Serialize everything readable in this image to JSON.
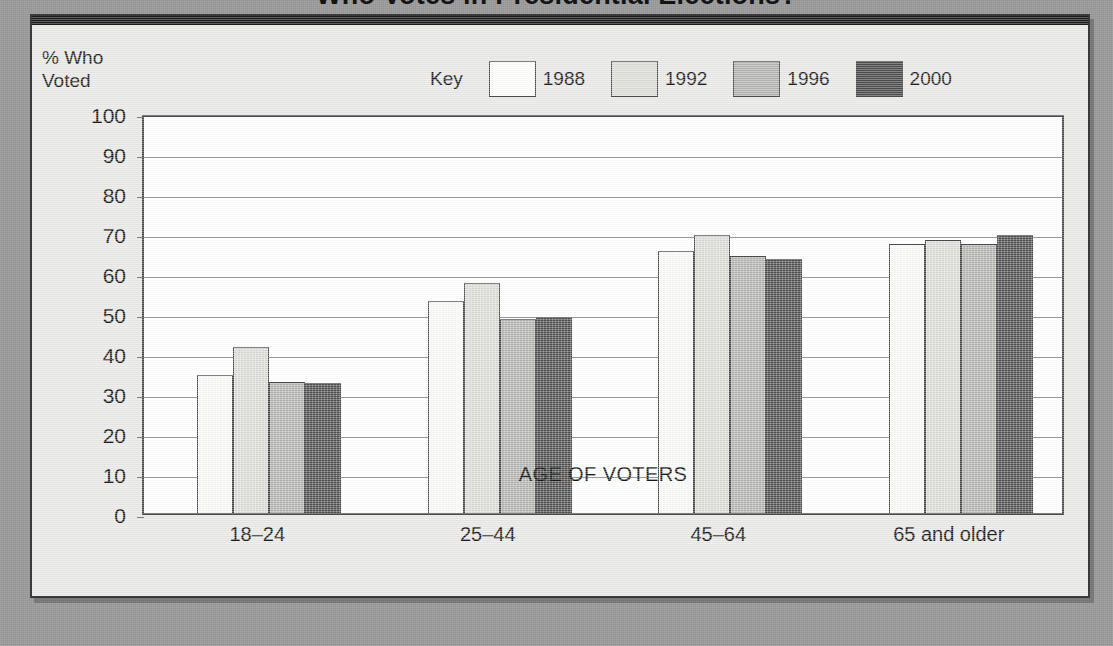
{
  "page": {
    "title_clipped": "Who Votes in Presidential Elections?",
    "background_color": "#9d9d9d",
    "card_color": "#e8e8e6"
  },
  "legend": {
    "key_label": "Key",
    "items": [
      {
        "label": "1988",
        "color": "#fbfbf9"
      },
      {
        "label": "1992",
        "color": "#dcdcd8"
      },
      {
        "label": "1996",
        "color": "#b4b4b1"
      },
      {
        "label": "2000",
        "color": "#4e4e4e"
      }
    ]
  },
  "axes": {
    "ylabel": "% Who\nVoted",
    "xlabel": "AGE OF VOTERS",
    "yticks": [
      "100",
      "90",
      "80",
      "70",
      "60",
      "50",
      "40",
      "30",
      "20",
      "10",
      "0"
    ]
  },
  "chart_data": {
    "type": "bar",
    "title": "Who Votes in Presidential Elections?",
    "xlabel": "AGE OF VOTERS",
    "ylabel": "% Who Voted",
    "ylim": [
      0,
      100
    ],
    "ytick_step": 10,
    "grid": true,
    "legend_position": "top",
    "legend_title": "Key",
    "categories": [
      "18–24",
      "25–44",
      "45–64",
      "65 and older"
    ],
    "series": [
      {
        "name": "1988",
        "color": "#fbfbf9",
        "values": [
          34.5,
          53.0,
          65.5,
          67.2
        ]
      },
      {
        "name": "1992",
        "color": "#dcdcd8",
        "values": [
          41.5,
          57.5,
          69.5,
          68.3
        ]
      },
      {
        "name": "1996",
        "color": "#b4b4b1",
        "values": [
          32.8,
          48.5,
          64.2,
          67.2
        ]
      },
      {
        "name": "2000",
        "color": "#4e4e4e",
        "values": [
          32.4,
          49.0,
          63.6,
          69.4
        ]
      }
    ]
  }
}
